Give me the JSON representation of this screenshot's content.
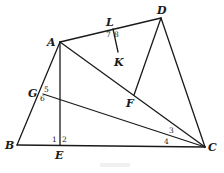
{
  "diagram": {
    "points": {
      "A": {
        "label": "A",
        "x": 60,
        "y": 42
      },
      "B": {
        "label": "B",
        "x": 17,
        "y": 145
      },
      "C": {
        "label": "C",
        "x": 205,
        "y": 147
      },
      "D": {
        "label": "D",
        "x": 161,
        "y": 18
      },
      "E": {
        "label": "E",
        "x": 60,
        "y": 145
      },
      "F": {
        "label": "F",
        "x": 134,
        "y": 95
      },
      "G": {
        "label": "G",
        "x": 43,
        "y": 94
      },
      "K": {
        "label": "K",
        "x": 118,
        "y": 52
      },
      "L": {
        "label": "L",
        "x": 113,
        "y": 29
      }
    },
    "segments": [
      "AB",
      "BC",
      "CD",
      "DA",
      "AC",
      "AE",
      "GC",
      "DF",
      "LK"
    ],
    "angle_labels": [
      "1",
      "2",
      "3",
      "4",
      "5",
      "6",
      "7",
      "8"
    ],
    "caption": ""
  }
}
